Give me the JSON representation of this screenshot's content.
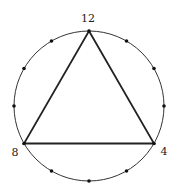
{
  "diagram": {
    "type": "clock-triangle",
    "circle": {
      "cx": 89,
      "cy": 106,
      "r": 75,
      "stroke": "#333333"
    },
    "tick_count": 12,
    "triangle_vertices": [
      12,
      4,
      8
    ],
    "labels": {
      "top": "12",
      "bottom_right": "4",
      "bottom_left": "8"
    },
    "colors": {
      "line": "#222222",
      "dot": "#111111",
      "background": "#ffffff"
    }
  }
}
